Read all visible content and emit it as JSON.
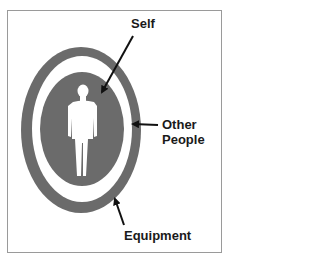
{
  "diagram": {
    "type": "concentric-zones",
    "colors": {
      "ring": "#6b6b6b",
      "gap": "#ffffff",
      "figure": "#ffffff",
      "arrow": "#111111",
      "frame": "#9a9a9a"
    },
    "labels": {
      "self": "Self",
      "other_people_line1": "Other",
      "other_people_line2": "People",
      "equipment": "Equipment"
    },
    "zones": [
      {
        "name": "Self",
        "description": "Inner filled ellipse containing human silhouette"
      },
      {
        "name": "Other People",
        "description": "White gap ring between inner and outer zones"
      },
      {
        "name": "Equipment",
        "description": "Outer gray ring"
      }
    ]
  }
}
